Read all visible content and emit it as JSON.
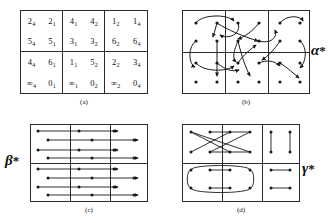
{
  "figure": {
    "title": "",
    "panels": [
      {
        "id": "a",
        "caption": "(a)",
        "type": "labelled-grid",
        "cells": [
          {
            "row": 0,
            "col": 0,
            "entries": [
              "2_4",
              "2_1",
              "5_4",
              "5_1"
            ]
          },
          {
            "row": 0,
            "col": 1,
            "entries": [
              "4_1",
              "4_2",
              "3_1",
              "3_2"
            ]
          },
          {
            "row": 0,
            "col": 2,
            "entries": [
              "1_2",
              "1_4",
              "6_2",
              "6_4"
            ]
          },
          {
            "row": 1,
            "col": 0,
            "entries": [
              "4_4",
              "6_1",
              "∞_4",
              "0_1"
            ]
          },
          {
            "row": 1,
            "col": 1,
            "entries": [
              "1_1",
              "5_2",
              "∞_1",
              "0_2"
            ]
          },
          {
            "row": 1,
            "col": 2,
            "entries": [
              "2_2",
              "3_4",
              "∞_2",
              "0_4"
            ]
          }
        ]
      },
      {
        "id": "b",
        "caption": "(b)",
        "type": "permutation-arrows",
        "label": "α",
        "label_star": "*",
        "rows": 4,
        "cols": 6
      },
      {
        "id": "c",
        "caption": "(c)",
        "type": "horizontal-arrows",
        "label": "β",
        "label_star": "*",
        "rows": 8,
        "cols": 6
      },
      {
        "id": "d",
        "caption": "(d)",
        "type": "involution-pairs",
        "label": "γ",
        "label_star": "*",
        "rows": 4,
        "cols": 6
      }
    ]
  },
  "panel_a": {
    "caption": "(a)",
    "cells": [
      {
        "a": "2",
        "as": "4",
        "b": "2",
        "bs": "1",
        "c": "5",
        "cs": "4",
        "d": "5",
        "ds": "1"
      },
      {
        "a": "4",
        "as": "1",
        "b": "4",
        "bs": "2",
        "c": "3",
        "cs": "1",
        "d": "3",
        "ds": "2"
      },
      {
        "a": "1",
        "as": "2",
        "b": "1",
        "bs": "4",
        "c": "6",
        "cs": "2",
        "d": "6",
        "ds": "4"
      },
      {
        "a": "4",
        "as": "4",
        "b": "6",
        "bs": "1",
        "c": "∞",
        "cs": "4",
        "d": "0",
        "ds": "1"
      },
      {
        "a": "1",
        "as": "1",
        "b": "5",
        "bs": "2",
        "c": "∞",
        "cs": "1",
        "d": "0",
        "ds": "2"
      },
      {
        "a": "2",
        "as": "2",
        "b": "3",
        "bs": "4",
        "c": "∞",
        "cs": "2",
        "d": "0",
        "ds": "4"
      }
    ]
  },
  "panel_b": {
    "caption": "(b)",
    "label": "α",
    "star": "*"
  },
  "panel_c": {
    "caption": "(c)",
    "label": "β",
    "star": "*"
  },
  "panel_d": {
    "caption": "(d)",
    "label": "γ",
    "star": "*"
  }
}
